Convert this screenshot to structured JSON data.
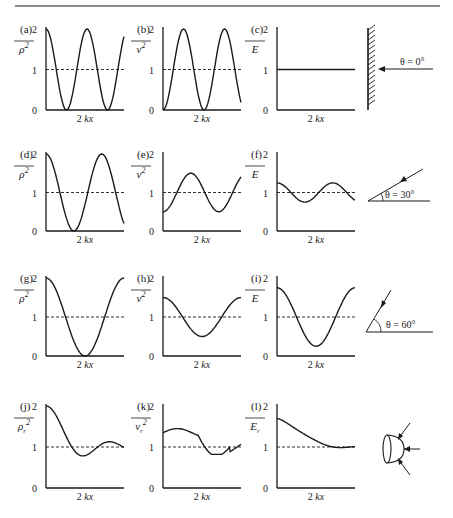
{
  "figure": {
    "top_rule": true,
    "x_axis_label": "2 kx",
    "y_ticks": [
      "0",
      "1",
      "2"
    ],
    "colors": {
      "ink": "#1a1a1a",
      "background": "#ffffff"
    }
  },
  "rows": [
    {
      "angle_label": "θ = 0°",
      "diagram": "wall-normal-incidence"
    },
    {
      "angle_label": "θ = 30°",
      "diagram": "oblique-30"
    },
    {
      "angle_label": "θ = 60°",
      "diagram": "oblique-60"
    },
    {
      "angle_label": "",
      "diagram": "random-incidence-hemisphere"
    }
  ],
  "panels": [
    {
      "id": "a",
      "label": "(a)",
      "ylabel": "ρ²",
      "overline": true,
      "sub": ""
    },
    {
      "id": "b",
      "label": "(b)",
      "ylabel": "v²",
      "overline": true,
      "sub": ""
    },
    {
      "id": "c",
      "label": "(c)",
      "ylabel": "E",
      "overline": true,
      "sub": ""
    },
    {
      "id": "d",
      "label": "(d)",
      "ylabel": "ρ²",
      "overline": true,
      "sub": ""
    },
    {
      "id": "e",
      "label": "(e)",
      "ylabel": "v²",
      "overline": true,
      "sub": ""
    },
    {
      "id": "f",
      "label": "(f)",
      "ylabel": "E",
      "overline": true,
      "sub": ""
    },
    {
      "id": "g",
      "label": "(g)",
      "ylabel": "ρ²",
      "overline": true,
      "sub": ""
    },
    {
      "id": "h",
      "label": "(h)",
      "ylabel": "v²",
      "overline": true,
      "sub": ""
    },
    {
      "id": "i",
      "label": "(i)",
      "ylabel": "E",
      "overline": true,
      "sub": ""
    },
    {
      "id": "j",
      "label": "(j)",
      "ylabel": "ρr²",
      "overline": true,
      "sub": "r"
    },
    {
      "id": "k",
      "label": "(k)",
      "ylabel": "vr²",
      "overline": true,
      "sub": "r"
    },
    {
      "id": "l",
      "label": "(l)",
      "ylabel": "Er",
      "overline": true,
      "sub": "r"
    }
  ],
  "chart_data": [
    {
      "panel": "a",
      "type": "line",
      "title": "(a)",
      "xlabel": "2 kx",
      "ylabel": "mean-square pressure ρ²",
      "ylim": [
        0,
        2
      ],
      "reference_line": 1,
      "x": [
        0,
        0.25,
        0.5,
        0.75,
        1.0,
        1.25,
        1.5,
        1.75,
        2.0
      ],
      "values": [
        2,
        1,
        0,
        1,
        2,
        1,
        0,
        0,
        0.2
      ]
    },
    {
      "panel": "b",
      "type": "line",
      "title": "(b)",
      "xlabel": "2 kx",
      "ylabel": "mean-square velocity v²",
      "ylim": [
        0,
        2
      ],
      "reference_line": 1,
      "x": [
        0,
        0.25,
        0.5,
        0.75,
        1.0,
        1.25,
        1.5,
        1.75,
        2.0
      ],
      "values": [
        0,
        1,
        2,
        1,
        0,
        1,
        2,
        2,
        1.8
      ]
    },
    {
      "panel": "c",
      "type": "line",
      "title": "(c)",
      "xlabel": "2 kx",
      "ylabel": "energy density E",
      "ylim": [
        0,
        2
      ],
      "reference_line": 1,
      "x": [
        0,
        1,
        2
      ],
      "values": [
        1,
        1,
        1
      ]
    },
    {
      "panel": "d",
      "type": "line",
      "title": "(d)",
      "xlabel": "2 kx",
      "ylabel": "ρ²",
      "ylim": [
        0,
        2
      ],
      "reference_line": 1,
      "x": [
        0,
        0.25,
        0.5,
        0.75,
        1.0,
        1.25,
        1.5
      ],
      "values": [
        2,
        1,
        0,
        1,
        2,
        1,
        0.3
      ]
    },
    {
      "panel": "e",
      "type": "line",
      "title": "(e)",
      "xlabel": "2 kx",
      "ylabel": "v²",
      "ylim": [
        0,
        2
      ],
      "reference_line": 1,
      "x": [
        0,
        0.25,
        0.5,
        0.75,
        1.0,
        1.25,
        1.5
      ],
      "values": [
        0.5,
        1,
        1.5,
        1,
        0.5,
        1,
        1.35
      ]
    },
    {
      "panel": "f",
      "type": "line",
      "title": "(f)",
      "xlabel": "2 kx",
      "ylabel": "E",
      "ylim": [
        0,
        2
      ],
      "reference_line": 1,
      "x": [
        0,
        0.25,
        0.5,
        0.75,
        1.0,
        1.25,
        1.5
      ],
      "values": [
        1.25,
        1,
        0.75,
        1,
        1.25,
        1,
        0.8
      ]
    },
    {
      "panel": "g",
      "type": "line",
      "title": "(g)",
      "xlabel": "2 kx",
      "ylabel": "ρ²",
      "ylim": [
        0,
        2
      ],
      "reference_line": 1,
      "x": [
        0,
        0.25,
        0.5,
        0.75,
        1.0
      ],
      "values": [
        2,
        1.6,
        0.5,
        0,
        1.2
      ]
    },
    {
      "panel": "h",
      "type": "line",
      "title": "(h)",
      "xlabel": "2 kx",
      "ylabel": "v²",
      "ylim": [
        0,
        2
      ],
      "reference_line": 1,
      "x": [
        0,
        0.25,
        0.5,
        0.75,
        1.0
      ],
      "values": [
        1.5,
        1.2,
        0.7,
        0.5,
        1.1
      ]
    },
    {
      "panel": "i",
      "type": "line",
      "title": "(i)",
      "xlabel": "2 kx",
      "ylabel": "E",
      "ylim": [
        0,
        2
      ],
      "reference_line": 1,
      "x": [
        0,
        0.25,
        0.5,
        0.75,
        1.0
      ],
      "values": [
        1.75,
        1.4,
        0.6,
        0.25,
        1.15
      ]
    },
    {
      "panel": "j",
      "type": "line",
      "title": "(j)",
      "xlabel": "2 kx",
      "ylabel": "ρr²",
      "ylim": [
        0,
        2
      ],
      "reference_line": 1,
      "x": [
        0,
        0.2,
        0.4,
        0.6,
        0.8,
        1.0
      ],
      "values": [
        2,
        1.5,
        0.85,
        0.95,
        1.1,
        0.9
      ]
    },
    {
      "panel": "k",
      "type": "line",
      "title": "(k)",
      "xlabel": "2 kx",
      "ylabel": "vr²",
      "ylim": [
        0,
        2
      ],
      "reference_line": 1,
      "x": [
        0,
        0.2,
        0.4,
        0.6,
        0.8,
        1.0
      ],
      "values": [
        1.35,
        1.4,
        1.25,
        0.95,
        0.85,
        1.05
      ]
    },
    {
      "panel": "l",
      "type": "line",
      "title": "(l)",
      "xlabel": "2 kx",
      "ylabel": "Er",
      "ylim": [
        0,
        2
      ],
      "reference_line": 1,
      "x": [
        0,
        0.2,
        0.4,
        0.6,
        0.8,
        1.0
      ],
      "values": [
        1.7,
        1.55,
        1.15,
        0.95,
        1.0,
        1.0
      ]
    }
  ]
}
